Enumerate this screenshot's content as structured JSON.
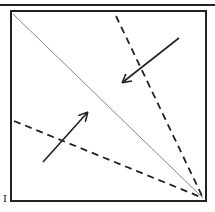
{
  "figure": {
    "label": "I",
    "colors": {
      "ink": "#222222",
      "fold_line": "#888888",
      "background": "#ffffff"
    },
    "box": {
      "x": 11,
      "y": 11,
      "width": 195,
      "height": 190
    },
    "lines": [
      {
        "name": "diagonal-fold-line",
        "style": "solid-thin",
        "x1": 13,
        "y1": 14,
        "x2": 203,
        "y2": 198
      },
      {
        "name": "upper-dashed-fold-line",
        "style": "dashed",
        "x1": 116,
        "y1": 16,
        "x2": 203,
        "y2": 198
      },
      {
        "name": "lower-dashed-fold-line",
        "style": "dashed",
        "x1": 14,
        "y1": 121,
        "x2": 203,
        "y2": 198
      }
    ],
    "arrows": [
      {
        "name": "upper-arrow",
        "x1": 179,
        "y1": 38,
        "x2": 123,
        "y2": 82
      },
      {
        "name": "lower-arrow",
        "x1": 43,
        "y1": 162,
        "x2": 87,
        "y2": 113
      }
    ]
  }
}
